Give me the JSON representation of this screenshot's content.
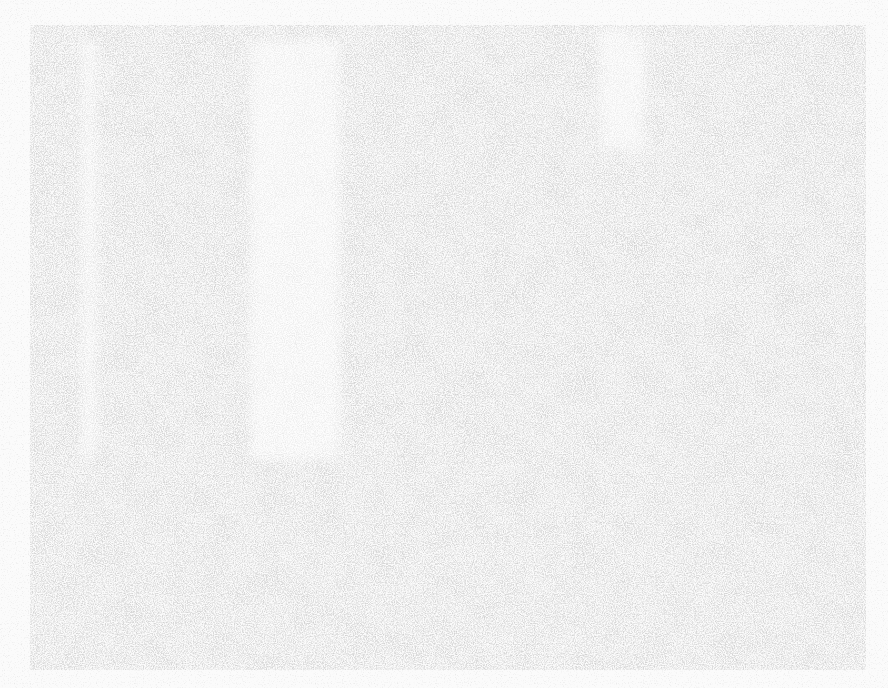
{
  "canvas": {
    "width": 888,
    "height": 688
  },
  "background": {
    "base_color": "#fbfbfb",
    "texture_color": "#b8b8b8",
    "texture": "speckled-noise"
  },
  "regions": [
    {
      "name": "outer-panel",
      "x": 30,
      "y": 25,
      "width": 836,
      "height": 645
    },
    {
      "name": "light-strip-left",
      "x": 82,
      "y": 40,
      "width": 14,
      "height": 420
    },
    {
      "name": "light-strip-center",
      "x": 250,
      "y": 40,
      "width": 90,
      "height": 420
    },
    {
      "name": "light-zone-top-right",
      "x": 600,
      "y": 30,
      "width": 45,
      "height": 120
    }
  ],
  "text": []
}
